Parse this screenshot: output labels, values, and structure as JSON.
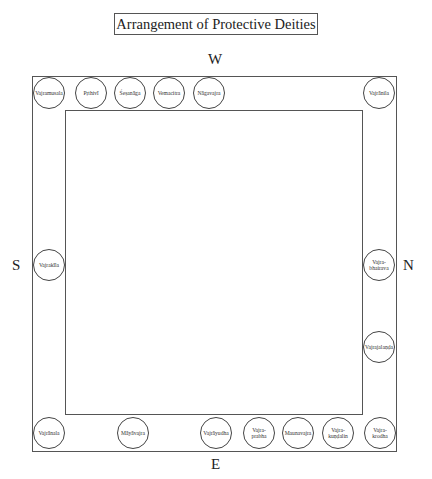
{
  "title": "Arrangement of Protective Deities",
  "directions": {
    "west": "W",
    "east": "E",
    "south": "S",
    "north": "N"
  },
  "deities": [
    {
      "name": "Vajramusala",
      "side": "W",
      "x": 33,
      "y": 77
    },
    {
      "name": "Pṛthivī",
      "side": "W",
      "x": 75,
      "y": 77
    },
    {
      "name": "Śeṣanāga",
      "side": "W",
      "x": 114,
      "y": 77
    },
    {
      "name": "Vemacitra",
      "side": "W",
      "x": 153,
      "y": 77
    },
    {
      "name": "Nāgavajra",
      "side": "W",
      "x": 193,
      "y": 77
    },
    {
      "name": "Vajrānila",
      "side": "W",
      "x": 363,
      "y": 77
    },
    {
      "name": "Vajrakīla",
      "side": "S",
      "x": 33,
      "y": 249
    },
    {
      "name": "Vajra-\nbhairava",
      "side": "N",
      "x": 363,
      "y": 249
    },
    {
      "name": "Vajrajalaṇḍa",
      "side": "N",
      "x": 363,
      "y": 331
    },
    {
      "name": "Vajrānala",
      "side": "E",
      "x": 33,
      "y": 417
    },
    {
      "name": "Māyāvajra",
      "side": "E",
      "x": 117,
      "y": 417
    },
    {
      "name": "Vajrāyudha",
      "side": "E",
      "x": 200,
      "y": 417
    },
    {
      "name": "Vajra-\nprabha",
      "side": "E",
      "x": 243,
      "y": 417
    },
    {
      "name": "Maunavajra",
      "side": "E",
      "x": 282,
      "y": 417
    },
    {
      "name": "Vajra-\nkuṇḍalin",
      "side": "E",
      "x": 322,
      "y": 417
    },
    {
      "name": "Vajra-\nkrodha",
      "side": "E",
      "x": 364,
      "y": 417
    }
  ]
}
